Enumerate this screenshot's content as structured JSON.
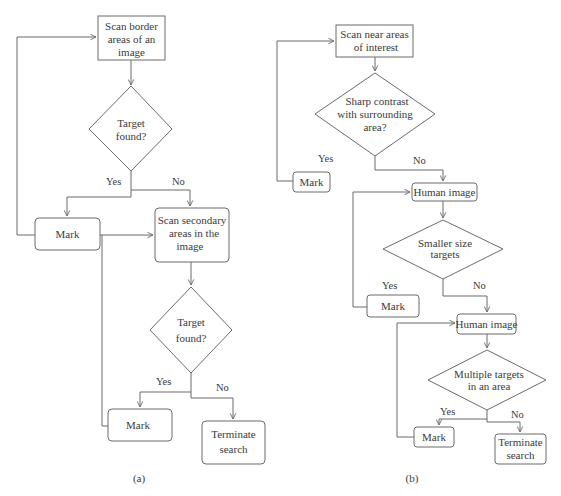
{
  "panels": [
    {
      "caption": "(a)",
      "nodes": {
        "scan_border": {
          "type": "process",
          "lines": [
            "Scan border",
            "areas of an",
            "image"
          ]
        },
        "decision1": {
          "type": "decision",
          "lines": [
            "Target",
            "found?"
          ]
        },
        "mark1": {
          "type": "terminal",
          "lines": [
            "Mark"
          ]
        },
        "scan_secondary": {
          "type": "terminal",
          "lines": [
            "Scan secondary",
            "areas in the",
            "image"
          ]
        },
        "decision2": {
          "type": "decision",
          "lines": [
            "Target",
            "found?"
          ]
        },
        "mark2": {
          "type": "terminal",
          "lines": [
            "Mark"
          ]
        },
        "terminate": {
          "type": "terminal",
          "lines": [
            "Terminate",
            "search"
          ]
        }
      },
      "edge_labels": {
        "d1_yes": "Yes",
        "d1_no": "No",
        "d2_yes": "Yes",
        "d2_no": "No"
      }
    },
    {
      "caption": "(b)",
      "nodes": {
        "scan_near": {
          "type": "process",
          "lines": [
            "Scan near areas",
            "of interest"
          ]
        },
        "decision1": {
          "type": "decision",
          "lines": [
            "Sharp contrast",
            "with surrounding",
            "area?"
          ]
        },
        "mark1": {
          "type": "terminal",
          "lines": [
            "Mark"
          ]
        },
        "human1": {
          "type": "terminal",
          "lines": [
            "Human image"
          ]
        },
        "decision2": {
          "type": "decision",
          "lines": [
            "Smaller size",
            "targets"
          ]
        },
        "mark2": {
          "type": "terminal",
          "lines": [
            "Mark"
          ]
        },
        "human2": {
          "type": "terminal",
          "lines": [
            "Human image"
          ]
        },
        "decision3": {
          "type": "decision",
          "lines": [
            "Multiple targets",
            "in an area"
          ]
        },
        "mark3": {
          "type": "terminal",
          "lines": [
            "Mark"
          ]
        },
        "terminate": {
          "type": "terminal",
          "lines": [
            "Terminate",
            "search"
          ]
        }
      },
      "edge_labels": {
        "d1_yes": "Yes",
        "d1_no": "No",
        "d2_yes": "Yes",
        "d2_no": "No",
        "d3_yes": "Yes",
        "d3_no": "No"
      }
    }
  ],
  "colors": {
    "stroke": "#6b6b6b",
    "text": "#3a3a3a",
    "background": "#ffffff"
  }
}
